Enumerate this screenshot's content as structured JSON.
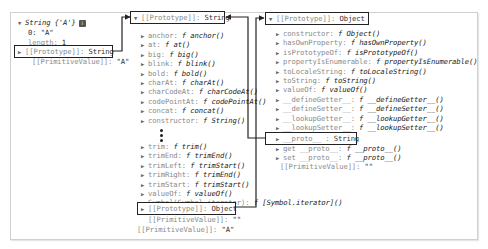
{
  "left": {
    "header": {
      "name": "String",
      "value": "{'A'}"
    },
    "rows": [
      {
        "key": "0",
        "value": "\"A\""
      },
      {
        "key": "length",
        "value": "1"
      }
    ],
    "prototype": {
      "key": "[[Prototype]]",
      "value": "String"
    },
    "primitive": {
      "key": "[[PrimitiveValue]]",
      "value": "\"A\""
    }
  },
  "middle": {
    "header": {
      "key": "[[Prototype]]",
      "value": "String"
    },
    "rows_top": [
      {
        "key": "anchor",
        "f": "f",
        "value": "anchor()"
      },
      {
        "key": "at",
        "f": "f",
        "value": "at()"
      },
      {
        "key": "big",
        "f": "f",
        "value": "big()"
      },
      {
        "key": "blink",
        "f": "f",
        "value": "blink()"
      },
      {
        "key": "bold",
        "f": "f",
        "value": "bold()"
      },
      {
        "key": "charAt",
        "f": "f",
        "value": "charAt()"
      },
      {
        "key": "charCodeAt",
        "f": "f",
        "value": "charCodeAt()"
      },
      {
        "key": "codePointAt",
        "f": "f",
        "value": "codePointAt()"
      },
      {
        "key": "concat",
        "f": "f",
        "value": "concat()"
      },
      {
        "key": "constructor",
        "f": "f",
        "value": "String()"
      }
    ],
    "ellipsis": "⋮",
    "rows_bottom": [
      {
        "key": "trim",
        "f": "f",
        "value": "trim()"
      },
      {
        "key": "trimEnd",
        "f": "f",
        "value": "trimEnd()"
      },
      {
        "key": "trimLeft",
        "f": "f",
        "value": "trimStart()"
      },
      {
        "key": "trimRight",
        "f": "f",
        "value": "trimEnd()"
      },
      {
        "key": "trimStart",
        "f": "f",
        "value": "trimStart()"
      },
      {
        "key": "valueOf",
        "f": "f",
        "value": "valueOf()"
      },
      {
        "key": "Symbol(Symbol.iterator)",
        "f": "f",
        "value": "[Symbol.iterator]()"
      }
    ],
    "prototype": {
      "key": "[[Prototype]]",
      "value": "Object"
    },
    "primitive_inner": {
      "key": "[[PrimitiveValue]]",
      "value": "\"\""
    },
    "primitive_outer": {
      "key": "[[PrimitiveValue]]",
      "value": "\"A\""
    }
  },
  "right": {
    "header": {
      "key": "[[Prototype]]",
      "value": "Object"
    },
    "rows": [
      {
        "key": "constructor",
        "f": "f",
        "value": "Object()"
      },
      {
        "key": "hasOwnProperty",
        "f": "f",
        "value": "hasOwnProperty()"
      },
      {
        "key": "isPrototypeOf",
        "f": "f",
        "value": "isPrototypeOf()"
      },
      {
        "key": "propertyIsEnumerable",
        "f": "f",
        "value": "propertyIsEnumerable()"
      },
      {
        "key": "toLocaleString",
        "f": "f",
        "value": "toLocaleString()"
      },
      {
        "key": "toString",
        "f": "f",
        "value": "toString()"
      },
      {
        "key": "valueOf",
        "f": "f",
        "value": "valueOf()"
      },
      {
        "key": "__defineGetter__",
        "f": "f",
        "value": "__defineGetter__()"
      },
      {
        "key": "__defineSetter__",
        "f": "f",
        "value": "__defineSetter__()"
      },
      {
        "key": "__lookupGetter__",
        "f": "f",
        "value": "__lookupGetter__()"
      },
      {
        "key": "__lookupSetter__",
        "f": "f",
        "value": "__lookupSetter__()"
      }
    ],
    "proto": {
      "key": "__proto__",
      "value": "String"
    },
    "accessors": [
      {
        "key": "get __proto__",
        "f": "f",
        "value": "__proto__()"
      },
      {
        "key": "set __proto__",
        "f": "f",
        "value": "__proto__()"
      }
    ],
    "primitive": {
      "key": "[[PrimitiveValue]]",
      "value": "\"\""
    }
  },
  "icons": {
    "expanded": "▼",
    "collapsed": "▶",
    "info": "i"
  },
  "colors": {
    "frame_border": "#d0d0d0",
    "box_border": "#222222",
    "key_gray": "#8a8a8a",
    "text_dark": "#222222"
  }
}
